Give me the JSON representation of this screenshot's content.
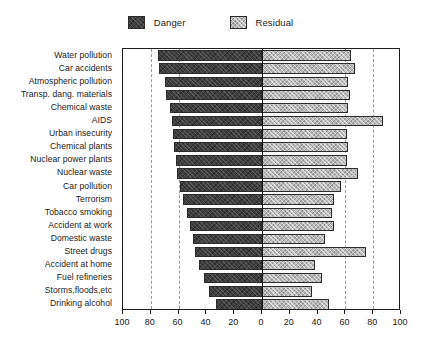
{
  "chart_data": {
    "type": "bar",
    "subtype": "diverging-horizontal-bar",
    "title": "",
    "subtitle": "",
    "xlabel": "",
    "ylabel": "",
    "xlim": [
      -100,
      100
    ],
    "grid": true,
    "grid_axis": "x",
    "grid_style": "dashed",
    "gridline_values": [
      -80,
      -60,
      60,
      80
    ],
    "legend_position": "top-center",
    "xticks": [
      -100,
      -80,
      -60,
      -40,
      -20,
      0,
      20,
      40,
      60,
      80,
      100
    ],
    "xticklabels": [
      "100",
      "80",
      "60",
      "40",
      "20",
      "0",
      "20",
      "40",
      "60",
      "80",
      "100"
    ],
    "categories": [
      "Water pollution",
      "Car accidents",
      "Atmospheric pollution",
      "Transp. dang. materials",
      "Chemical waste",
      "AIDS",
      "Urban insecurity",
      "Chemical plants",
      "Nuclear power plants",
      "Nuclear waste",
      "Car pollution",
      "Terrorism",
      "Tobacco smoking",
      "Accident at work",
      "Domestic waste",
      "Street drugs",
      "Accident at home",
      "Fuel refineries",
      "Storms,floods,etc",
      "Drinking alcohol"
    ],
    "series": [
      {
        "name": "Danger",
        "direction": "left",
        "color": "#3d3d3d",
        "values": [
          75,
          74,
          70,
          69,
          66,
          65,
          64,
          63,
          62,
          61,
          59,
          57,
          54,
          52,
          50,
          48,
          45,
          42,
          38,
          33
        ]
      },
      {
        "name": "Residual",
        "direction": "right",
        "color": "#b9b9b9",
        "values": [
          64,
          67,
          62,
          63,
          62,
          87,
          61,
          62,
          61,
          69,
          57,
          52,
          50,
          52,
          45,
          75,
          38,
          43,
          36,
          48
        ]
      }
    ]
  },
  "legend": {
    "entries": [
      {
        "label": "Danger",
        "swatch": "danger-swatch",
        "color": "#3d3d3d"
      },
      {
        "label": "Residual",
        "swatch": "residual-swatch",
        "color": "#b9b9b9"
      }
    ]
  },
  "colors": {
    "danger": "#3d3d3d",
    "residual": "#b9b9b9",
    "axis": "#1d1d1d",
    "grid": "#9a9a9a",
    "background": "#ffffff"
  }
}
